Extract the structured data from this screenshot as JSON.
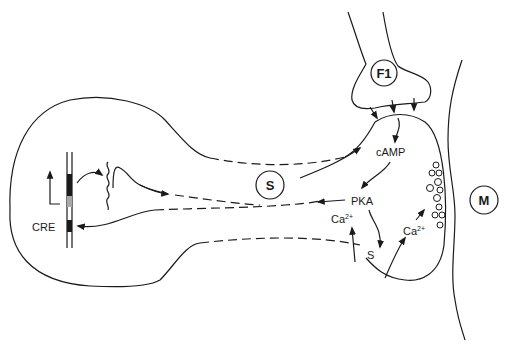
{
  "diagram": {
    "type": "signaling-pathway",
    "cells": {
      "sensory_neuron": {
        "label": "S"
      },
      "facilitatory_interneuron": {
        "label": "F1"
      },
      "motor_neuron": {
        "label": "M"
      }
    },
    "nucleus": {
      "gene_element_label": "CRE"
    },
    "molecules": {
      "camp": "cAMP",
      "pka": "PKA",
      "calcium_left": "Ca",
      "calcium_left_sup": "2+",
      "calcium_right": "Ca",
      "calcium_right_sup": "2+",
      "s_channel": "S"
    },
    "vesicle_count": 14,
    "colors": {
      "stroke": "#1a1a1a",
      "background": "#ffffff",
      "gray_block": "#a8a8a8"
    }
  }
}
